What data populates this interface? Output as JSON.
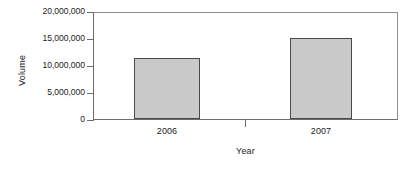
{
  "chart_data": {
    "type": "bar",
    "title": "",
    "subtitle": "",
    "xlabel": "Year",
    "ylabel": "Volume",
    "categories": [
      "2006",
      "2007"
    ],
    "values": [
      11600000,
      15300000
    ],
    "series": [
      {
        "name": "Volume",
        "values": [
          11600000,
          15300000
        ]
      }
    ],
    "ylim": [
      0,
      20000000
    ],
    "ytick_labels": [
      "20,000,000",
      "15,000,000",
      "10,000,000",
      "5,000,000",
      "0"
    ],
    "ytick_values": [
      20000000,
      15000000,
      10000000,
      5000000,
      0
    ],
    "grid": false,
    "legend": false,
    "legend_position": "none",
    "bar_fill_color": "#c9c9c9",
    "bar_border_color": "#4a4a4a",
    "axis_color": "#6d6d6d",
    "text_color": "#1c1c1c",
    "background_color": "#ffffff",
    "annotations": []
  }
}
